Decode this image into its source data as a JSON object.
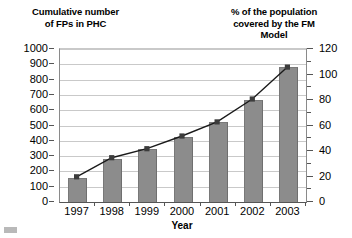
{
  "chart_data": {
    "type": "bar",
    "title": "",
    "categories": [
      "1997",
      "1998",
      "1999",
      "2000",
      "2001",
      "2002",
      "2003"
    ],
    "xlabel": "Year",
    "grid": true,
    "legend": "none",
    "series": [
      {
        "name": "Cumulative number of FPs in PHC",
        "type": "bar",
        "axis": "left",
        "values": [
          157,
          280,
          345,
          425,
          520,
          670,
          880
        ]
      },
      {
        "name": "% of the population covered by the FM Model",
        "type": "line",
        "axis": "right",
        "values": [
          19,
          34,
          41,
          51,
          62,
          80,
          105
        ]
      }
    ],
    "left_axis": {
      "label": "Cumulative number\nof FPs in PHC",
      "ylim": [
        0,
        1000
      ],
      "ticks": [
        "0",
        "100",
        "200",
        "300",
        "400",
        "500",
        "600",
        "700",
        "800",
        "900",
        "1000"
      ]
    },
    "right_axis": {
      "label": "% of the population\ncovered by the FM\nModel",
      "ylim": [
        0,
        120
      ],
      "ticks": [
        "0",
        "20",
        "40",
        "60",
        "80",
        "100",
        "120"
      ],
      "minor_tick_step": 10
    },
    "colors": {
      "bar_fill": "#8c8c8c",
      "line": "#1a1a1a",
      "marker": "#3c3c3c",
      "gridline": "#c9c9c9",
      "axis": "#555555",
      "background": "#ffffff"
    }
  }
}
